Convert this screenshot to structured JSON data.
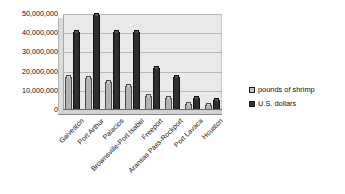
{
  "chart_data": {
    "type": "bar",
    "title": "",
    "xlabel": "",
    "ylabel": "",
    "ylim": [
      0,
      50000000
    ],
    "grid": true,
    "legend_position": "right",
    "ytick_labels": [
      "50,000,000",
      "40,000,000",
      "30,000,000",
      "20,000,000",
      "10,000,000",
      "0"
    ],
    "ytick_values": [
      50000000,
      40000000,
      30000000,
      20000000,
      10000000,
      0
    ],
    "categories": [
      "Galveston",
      "Port Arthur",
      "Palacios",
      "Brownsville-Port Isabel",
      "Freeport",
      "Aransas Pass-Rockport",
      "Port Lavaca",
      "Houston"
    ],
    "series": [
      {
        "name": "pounds of shrimp",
        "color": "#b2b2b2",
        "values": [
          17000000,
          16800000,
          14500000,
          12500000,
          7300000,
          6300000,
          3000000,
          2500000
        ]
      },
      {
        "name": "U.S. dollars",
        "color": "#2e2e2e",
        "values": [
          40500000,
          49500000,
          40500000,
          40500000,
          22000000,
          17000000,
          6000000,
          5000000
        ]
      }
    ]
  },
  "legend": {
    "items": [
      {
        "label": "pounds of shrimp",
        "swatch": "pounds"
      },
      {
        "label": "U.S. dollars",
        "swatch": "dollars"
      }
    ]
  }
}
